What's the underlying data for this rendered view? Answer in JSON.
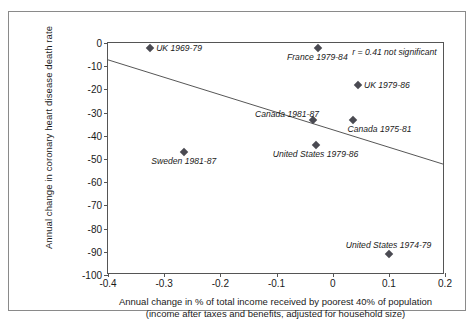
{
  "chart_data": {
    "type": "scatter",
    "title": "",
    "xlabel_line1": "Annual change in % of total income received by poorest 40% of population",
    "xlabel_line2": "(income after taxes and benefits, adjusted for household size)",
    "ylabel": "Annual change in coronary heart disease death rate",
    "xlim": [
      -0.4,
      0.2
    ],
    "ylim": [
      -100,
      0
    ],
    "xticks": [
      "-0.4",
      "-0.3",
      "-0.2",
      "-0.1",
      "0",
      "0.1",
      "0.2"
    ],
    "xtick_values": [
      -0.4,
      -0.3,
      -0.2,
      -0.1,
      0,
      0.1,
      0.2
    ],
    "yticks": [
      "0",
      "-10",
      "-20",
      "-30",
      "-40",
      "-50",
      "-60",
      "-70",
      "-80",
      "-90",
      "-100"
    ],
    "ytick_values": [
      0,
      -10,
      -20,
      -30,
      -40,
      -50,
      -60,
      -70,
      -80,
      -90,
      -100
    ],
    "grid": false,
    "legend": "none",
    "annotation": "r = 0.41 not significant",
    "annotation_x": 0.035,
    "annotation_y": -4,
    "trendline": {
      "x1": -0.4,
      "y1": -7.3,
      "x2": 0.2,
      "y2": -52.5
    },
    "points": [
      {
        "label": "UK 1969-79",
        "x": -0.325,
        "y": -2,
        "label_pos": "right"
      },
      {
        "label": "France 1979-84",
        "x": -0.027,
        "y": -2,
        "label_pos": "below"
      },
      {
        "label": "UK 1979-86",
        "x": 0.045,
        "y": -18,
        "label_pos": "right"
      },
      {
        "label": "Canada 1981-87",
        "x": -0.035,
        "y": -33,
        "label_pos": "above-left"
      },
      {
        "label": "Canada 1975-81",
        "x": 0.037,
        "y": -33,
        "label_pos": "below-right"
      },
      {
        "label": "United States 1979-86",
        "x": -0.03,
        "y": -44,
        "label_pos": "below"
      },
      {
        "label": "Sweden 1981-87",
        "x": -0.265,
        "y": -47,
        "label_pos": "below"
      },
      {
        "label": "United States 1974-79",
        "x": 0.1,
        "y": -91,
        "label_pos": "above"
      }
    ]
  },
  "colors": {
    "marker": "#4a4a52",
    "axis": "#555555",
    "frame": "#8a8a8a",
    "text": "#1a1a1a"
  }
}
